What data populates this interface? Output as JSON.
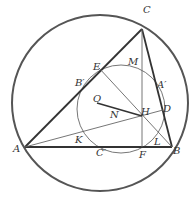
{
  "diagram": {
    "colors": {
      "stroke": "#3a3a3a",
      "circumcircle": "#555555",
      "thin": "#666666",
      "label": "#333333"
    },
    "circumcircle": {
      "cx": 100,
      "cy": 103,
      "r": 88
    },
    "nine_point_circle": {
      "cx": 121,
      "cy": 109,
      "r": 44
    },
    "points": {
      "A": [
        25,
        147
      ],
      "B": [
        172,
        147
      ],
      "C": [
        142,
        29
      ],
      "H": [
        142,
        116
      ],
      "F": [
        142,
        147
      ],
      "O": [
        97,
        103
      ],
      "D": [
        163,
        110
      ],
      "E": [
        99,
        68
      ],
      "K": [
        80,
        137
      ],
      "L": [
        157,
        139
      ]
    },
    "labels": [
      {
        "text": "C",
        "x": 143,
        "y": 13
      },
      {
        "text": "M",
        "x": 128,
        "y": 65
      },
      {
        "text": "E",
        "x": 93,
        "y": 70
      },
      {
        "text": "B′",
        "x": 75,
        "y": 86
      },
      {
        "text": "A′",
        "x": 157,
        "y": 88
      },
      {
        "text": "O",
        "x": 93,
        "y": 102
      },
      {
        "text": "H",
        "x": 141,
        "y": 115
      },
      {
        "text": "D",
        "x": 163,
        "y": 112
      },
      {
        "text": "N",
        "x": 110,
        "y": 118
      },
      {
        "text": "K",
        "x": 75,
        "y": 143
      },
      {
        "text": "L",
        "x": 154,
        "y": 145
      },
      {
        "text": "A",
        "x": 13,
        "y": 152
      },
      {
        "text": "C′",
        "x": 96,
        "y": 156
      },
      {
        "text": "F",
        "x": 139,
        "y": 158
      },
      {
        "text": "B",
        "x": 173,
        "y": 154
      }
    ]
  }
}
